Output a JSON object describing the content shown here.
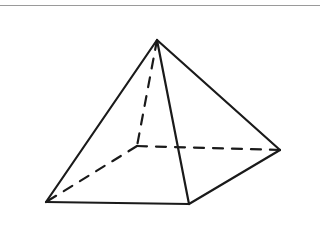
{
  "figure": {
    "background_color": "#ffffff",
    "stroke_color": "#1a1a1a",
    "stroke_width": 2.2,
    "hidden_stroke_width": 2.2,
    "dash_pattern": "10 9",
    "top_rule": {
      "color": "#9a9a9a",
      "y": 5,
      "thickness": 1
    },
    "vertices": {
      "apex": {
        "label": "apex",
        "x": 157,
        "y": 40
      },
      "front_left": {
        "label": "front-left-corner",
        "x": 46,
        "y": 202
      },
      "front_right": {
        "label": "front-right-corner",
        "x": 189,
        "y": 204
      },
      "right": {
        "label": "right-corner",
        "x": 280,
        "y": 150
      },
      "back": {
        "label": "back-corner-hidden",
        "x": 137,
        "y": 146
      }
    },
    "visible_edges": [
      {
        "name": "apex-to-front-left",
        "from": "apex",
        "to": "front_left"
      },
      {
        "name": "apex-to-front-right",
        "from": "apex",
        "to": "front_right"
      },
      {
        "name": "apex-to-right",
        "from": "apex",
        "to": "right"
      },
      {
        "name": "base-front-left-to-front-right",
        "from": "front_left",
        "to": "front_right"
      },
      {
        "name": "base-front-right-to-right",
        "from": "front_right",
        "to": "right"
      }
    ],
    "hidden_edges": [
      {
        "name": "apex-to-back",
        "from": "apex",
        "to": "back"
      },
      {
        "name": "base-back-to-right",
        "from": "back",
        "to": "right"
      },
      {
        "name": "base-back-to-front-left",
        "from": "back",
        "to": "front_left"
      }
    ]
  }
}
